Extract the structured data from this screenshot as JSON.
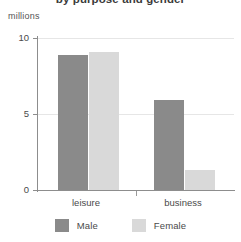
{
  "chart_data": {
    "type": "bar",
    "title": "by purpose and gender",
    "subtitle": "",
    "xlabel": "",
    "ylabel": "millions",
    "unit_caption": "millions",
    "categories": [
      "leisure",
      "business"
    ],
    "series": [
      {
        "name": "Male",
        "color": "#8a8a8a",
        "values": [
          8.9,
          5.9
        ]
      },
      {
        "name": "Female",
        "color": "#d9d9d9",
        "values": [
          9.1,
          1.3
        ]
      }
    ],
    "ylim": [
      0,
      10
    ],
    "yticks": [
      0,
      5,
      10
    ],
    "ytick_labels": [
      "0",
      "5",
      "10"
    ],
    "grid": true,
    "legend_position": "bottom",
    "orientation": "vertical"
  },
  "legend": {
    "items": [
      {
        "label": "Male",
        "color": "#8a8a8a"
      },
      {
        "label": "Female",
        "color": "#d9d9d9"
      }
    ]
  },
  "axis": {
    "y_labels": [
      "10",
      "5",
      "0"
    ],
    "x_labels": [
      "leisure",
      "business"
    ]
  }
}
